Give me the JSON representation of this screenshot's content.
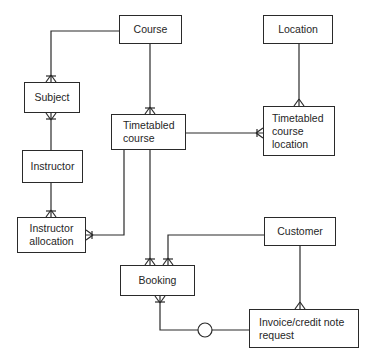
{
  "diagram": {
    "type": "entity-relationship",
    "notation": "crow's foot",
    "entities": {
      "course": {
        "label": "Course"
      },
      "location": {
        "label": "Location"
      },
      "subject": {
        "label": "Subject"
      },
      "timetabled_course": {
        "label": "Timetabled\ncourse"
      },
      "timetabled_course_location": {
        "label": "Timetabled\ncourse\nlocation"
      },
      "instructor": {
        "label": "Instructor"
      },
      "instructor_allocation": {
        "label": "Instructor\nallocation"
      },
      "customer": {
        "label": "Customer"
      },
      "booking": {
        "label": "Booking"
      },
      "invoice_request": {
        "label": "Invoice/credit note\nrequest"
      }
    },
    "relationships": [
      {
        "from": "Course",
        "to": "Subject",
        "cardinality": "one-to-many"
      },
      {
        "from": "Course",
        "to": "Timetabled course",
        "cardinality": "one-to-many"
      },
      {
        "from": "Location",
        "to": "Timetabled course location",
        "cardinality": "one-to-many"
      },
      {
        "from": "Timetabled course",
        "to": "Timetabled course location",
        "cardinality": "one-to-many"
      },
      {
        "from": "Instructor",
        "to": "Subject",
        "cardinality": "one-to-many"
      },
      {
        "from": "Instructor",
        "to": "Instructor allocation",
        "cardinality": "one-to-many"
      },
      {
        "from": "Timetabled course",
        "to": "Instructor allocation",
        "cardinality": "one-to-many"
      },
      {
        "from": "Timetabled course",
        "to": "Booking",
        "cardinality": "one-to-many"
      },
      {
        "from": "Customer",
        "to": "Booking",
        "cardinality": "one-to-many"
      },
      {
        "from": "Customer",
        "to": "Invoice/credit note request",
        "cardinality": "one-to-many"
      },
      {
        "from": "Invoice/credit note request",
        "to": "Booking",
        "cardinality": "one-to-many",
        "optional": true
      }
    ],
    "colors": {
      "line": "#2a2a2a",
      "text": "#262626",
      "background": "#ffffff"
    }
  }
}
